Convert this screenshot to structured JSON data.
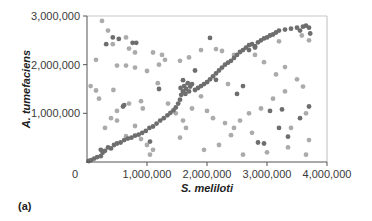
{
  "panel_label": "(a)",
  "colors": {
    "dark_point": "#6e6e6e",
    "light_point": "#ababab",
    "axis": "#555555",
    "frame": "#c8c8c8"
  },
  "chart_data": {
    "type": "scatter",
    "title": "",
    "xlabel": "S. meliloti",
    "ylabel": "A. tumefaciens",
    "xlim": [
      0,
      4000000
    ],
    "ylim": [
      0,
      3000000
    ],
    "xticks": [
      0,
      1000000,
      2000000,
      3000000,
      4000000
    ],
    "xtick_labels": [
      "0",
      "1,000,000",
      "2,000,000",
      "3,000,000",
      "4,000,000"
    ],
    "yticks": [
      1000000,
      2000000,
      3000000
    ],
    "ytick_labels": [
      "1,000,000",
      "2,000,000",
      "3,000,000"
    ],
    "grid": false,
    "legend": null,
    "series": [
      {
        "name": "dark",
        "color": "#6e6e6e",
        "points": [
          [
            30000,
            20000
          ],
          [
            70000,
            40000
          ],
          [
            120000,
            70000
          ],
          [
            170000,
            100000
          ],
          [
            230000,
            120000
          ],
          [
            260000,
            190000
          ],
          [
            230000,
            250000
          ],
          [
            300000,
            230000
          ],
          [
            350000,
            300000
          ],
          [
            400000,
            280000
          ],
          [
            450000,
            350000
          ],
          [
            500000,
            380000
          ],
          [
            560000,
            400000
          ],
          [
            620000,
            450000
          ],
          [
            680000,
            480000
          ],
          [
            740000,
            500000
          ],
          [
            800000,
            540000
          ],
          [
            860000,
            560000
          ],
          [
            920000,
            600000
          ],
          [
            980000,
            640000
          ],
          [
            1040000,
            700000
          ],
          [
            1100000,
            730000
          ],
          [
            1160000,
            790000
          ],
          [
            1220000,
            850000
          ],
          [
            1280000,
            900000
          ],
          [
            1340000,
            960000
          ],
          [
            1390000,
            1010000
          ],
          [
            1440000,
            1060000
          ],
          [
            1480000,
            1120000
          ],
          [
            1520000,
            1200000
          ],
          [
            1550000,
            1280000
          ],
          [
            1570000,
            1380000
          ],
          [
            1600000,
            1450000
          ],
          [
            1560000,
            1520000
          ],
          [
            1620000,
            1560000
          ],
          [
            1650000,
            1500000
          ],
          [
            1680000,
            1620000
          ],
          [
            1600000,
            1680000
          ],
          [
            1640000,
            1400000
          ],
          [
            1700000,
            1450000
          ],
          [
            1720000,
            1550000
          ],
          [
            1750000,
            1600000
          ],
          [
            1800000,
            1480000
          ],
          [
            1850000,
            1520000
          ],
          [
            1900000,
            1560000
          ],
          [
            1950000,
            1600000
          ],
          [
            2000000,
            1640000
          ],
          [
            2050000,
            1700000
          ],
          [
            2100000,
            1760000
          ],
          [
            2150000,
            1820000
          ],
          [
            2200000,
            1880000
          ],
          [
            2250000,
            1940000
          ],
          [
            2300000,
            2000000
          ],
          [
            2350000,
            2040000
          ],
          [
            2400000,
            2080000
          ],
          [
            2450000,
            2140000
          ],
          [
            2500000,
            2200000
          ],
          [
            2550000,
            2260000
          ],
          [
            2600000,
            2300000
          ],
          [
            2650000,
            2350000
          ],
          [
            2700000,
            2400000
          ],
          [
            2750000,
            2420000
          ],
          [
            2800000,
            2380000
          ],
          [
            2850000,
            2460000
          ],
          [
            2900000,
            2500000
          ],
          [
            2950000,
            2540000
          ],
          [
            3000000,
            2560000
          ],
          [
            3050000,
            2600000
          ],
          [
            3100000,
            2620000
          ],
          [
            3150000,
            2660000
          ],
          [
            3200000,
            2700000
          ],
          [
            3300000,
            2720000
          ],
          [
            3400000,
            2740000
          ],
          [
            3500000,
            2760000
          ],
          [
            3550000,
            2700000
          ],
          [
            3600000,
            2780000
          ],
          [
            3650000,
            2800000
          ],
          [
            3700000,
            2760000
          ],
          [
            3720000,
            2640000
          ],
          [
            430000,
            2560000
          ],
          [
            530000,
            2530000
          ],
          [
            760000,
            2450000
          ],
          [
            820000,
            2450000
          ],
          [
            320000,
            2420000
          ],
          [
            2050000,
            2550000
          ],
          [
            2700000,
            2300000
          ],
          [
            2800000,
            2350000
          ],
          [
            1200000,
            1500000
          ],
          [
            600000,
            1140000
          ],
          [
            2500000,
            1400000
          ],
          [
            1800000,
            1880000
          ],
          [
            3050000,
            1050000
          ],
          [
            3250000,
            1080000
          ],
          [
            2600000,
            1560000
          ],
          [
            620000,
            1170000
          ],
          [
            2150000,
            1690000
          ],
          [
            2850000,
            400000
          ],
          [
            2950000,
            380000
          ],
          [
            3200000,
            700000
          ],
          [
            3350000,
            520000
          ],
          [
            1050000,
            420000
          ],
          [
            3550000,
            900000
          ],
          [
            3700000,
            1140000
          ]
        ]
      },
      {
        "name": "light",
        "color": "#ababab",
        "points": [
          [
            250000,
            2900000
          ],
          [
            350000,
            2700000
          ],
          [
            430000,
            2420000
          ],
          [
            650000,
            2560000
          ],
          [
            700000,
            2330000
          ],
          [
            800000,
            2250000
          ],
          [
            1100000,
            2250000
          ],
          [
            150000,
            2100000
          ],
          [
            500000,
            1980000
          ],
          [
            650000,
            1980000
          ],
          [
            800000,
            1940000
          ],
          [
            1000000,
            1870000
          ],
          [
            1250000,
            2200000
          ],
          [
            1300000,
            2100000
          ],
          [
            1550000,
            2080000
          ],
          [
            1700000,
            2150000
          ],
          [
            1900000,
            2300000
          ],
          [
            2150000,
            2320000
          ],
          [
            2250000,
            2280000
          ],
          [
            2450000,
            2200000
          ],
          [
            2800000,
            2200000
          ],
          [
            2950000,
            2050000
          ],
          [
            3200000,
            2480000
          ],
          [
            3300000,
            1950000
          ],
          [
            3580000,
            2600000
          ],
          [
            3700000,
            2500000
          ],
          [
            60000,
            1560000
          ],
          [
            150000,
            1470000
          ],
          [
            200000,
            1300000
          ],
          [
            440000,
            1480000
          ],
          [
            700000,
            1200000
          ],
          [
            500000,
            1050000
          ],
          [
            930000,
            1100000
          ],
          [
            1180000,
            1620000
          ],
          [
            1350000,
            1200000
          ],
          [
            1480000,
            1000000
          ],
          [
            800000,
            740000
          ],
          [
            650000,
            530000
          ],
          [
            900000,
            470000
          ],
          [
            1000000,
            350000
          ],
          [
            1100000,
            250000
          ],
          [
            500000,
            850000
          ],
          [
            300000,
            700000
          ],
          [
            400000,
            900000
          ],
          [
            1600000,
            850000
          ],
          [
            1750000,
            1100000
          ],
          [
            1900000,
            1350000
          ],
          [
            2000000,
            1050000
          ],
          [
            2100000,
            900000
          ],
          [
            2300000,
            800000
          ],
          [
            2450000,
            700000
          ],
          [
            2550000,
            850000
          ],
          [
            2700000,
            1000000
          ],
          [
            2900000,
            1100000
          ],
          [
            3100000,
            1300000
          ],
          [
            3300000,
            1450000
          ],
          [
            3500000,
            1700000
          ],
          [
            3600000,
            1550000
          ],
          [
            3650000,
            1000000
          ],
          [
            3700000,
            450000
          ],
          [
            3400000,
            700000
          ],
          [
            2400000,
            550000
          ],
          [
            2200000,
            350000
          ],
          [
            1950000,
            250000
          ],
          [
            2600000,
            150000
          ],
          [
            3000000,
            200000
          ],
          [
            3650000,
            150000
          ],
          [
            1050000,
            150000
          ],
          [
            1650000,
            700000
          ],
          [
            1550000,
            500000
          ],
          [
            2750000,
            600000
          ],
          [
            3350000,
            300000
          ],
          [
            900000,
            1250000
          ],
          [
            1200000,
            2000000
          ],
          [
            2350000,
            1600000
          ],
          [
            3150000,
            1800000
          ]
        ]
      }
    ]
  }
}
